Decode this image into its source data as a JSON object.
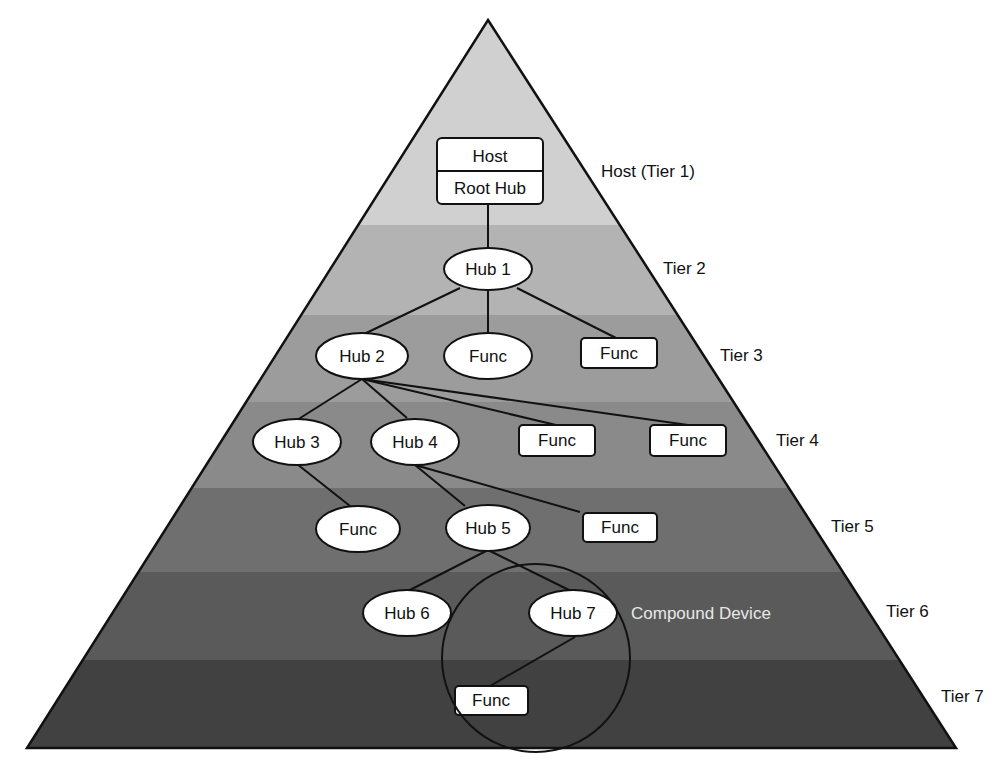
{
  "diagram": {
    "tiers": [
      {
        "id": "tier1",
        "label": "Host (Tier 1)",
        "color": "#d0d0d0"
      },
      {
        "id": "tier2",
        "label": "Tier 2",
        "color": "#b3b3b3"
      },
      {
        "id": "tier3",
        "label": "Tier 3",
        "color": "#9c9c9c"
      },
      {
        "id": "tier4",
        "label": "Tier 4",
        "color": "#8a8a8a"
      },
      {
        "id": "tier5",
        "label": "Tier 5",
        "color": "#6f6f6f"
      },
      {
        "id": "tier6",
        "label": "Tier 6",
        "color": "#5a5a5a"
      },
      {
        "id": "tier7",
        "label": "Tier 7",
        "color": "#414141"
      }
    ],
    "host": {
      "top": "Host",
      "bottom": "Root Hub"
    },
    "nodes": [
      {
        "id": "hub1",
        "label": "Hub 1",
        "shape": "ellipse",
        "tier": 2
      },
      {
        "id": "hub2",
        "label": "Hub 2",
        "shape": "ellipse",
        "tier": 3
      },
      {
        "id": "func3a",
        "label": "Func",
        "shape": "ellipse",
        "tier": 3
      },
      {
        "id": "func3b",
        "label": "Func",
        "shape": "rect",
        "tier": 3
      },
      {
        "id": "hub3",
        "label": "Hub 3",
        "shape": "ellipse",
        "tier": 4
      },
      {
        "id": "hub4",
        "label": "Hub 4",
        "shape": "ellipse",
        "tier": 4
      },
      {
        "id": "func4a",
        "label": "Func",
        "shape": "rect",
        "tier": 4
      },
      {
        "id": "func4b",
        "label": "Func",
        "shape": "rect",
        "tier": 4
      },
      {
        "id": "func5a",
        "label": "Func",
        "shape": "ellipse",
        "tier": 5
      },
      {
        "id": "hub5",
        "label": "Hub 5",
        "shape": "ellipse",
        "tier": 5
      },
      {
        "id": "func5b",
        "label": "Func",
        "shape": "rect",
        "tier": 5
      },
      {
        "id": "hub6",
        "label": "Hub 6",
        "shape": "ellipse",
        "tier": 6
      },
      {
        "id": "hub7",
        "label": "Hub 7",
        "shape": "ellipse",
        "tier": 6
      },
      {
        "id": "func7",
        "label": "Func",
        "shape": "rect",
        "tier": 7
      }
    ],
    "edges": [
      [
        "host",
        "hub1"
      ],
      [
        "hub1",
        "hub2"
      ],
      [
        "hub1",
        "func3a"
      ],
      [
        "hub1",
        "func3b"
      ],
      [
        "hub2",
        "hub3"
      ],
      [
        "hub2",
        "hub4"
      ],
      [
        "hub2",
        "func4a"
      ],
      [
        "hub2",
        "func4b"
      ],
      [
        "hub3",
        "func5a"
      ],
      [
        "hub4",
        "hub5"
      ],
      [
        "hub4",
        "func5b"
      ],
      [
        "hub5",
        "hub6"
      ],
      [
        "hub5",
        "hub7"
      ],
      [
        "hub7",
        "func7"
      ]
    ],
    "compound_device_label": "Compound Device",
    "line_color": "#111111",
    "node_fill": "#ffffff"
  }
}
